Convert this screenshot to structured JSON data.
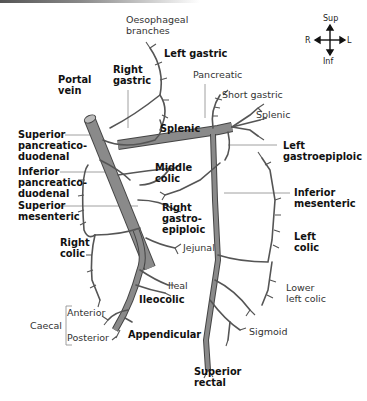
{
  "diagram": {
    "orientation": {
      "sup": "Sup",
      "inf": "Inf",
      "right": "R",
      "left": "L"
    },
    "labels": {
      "oesophageal": "Oesophageal\nbranches",
      "left_gastric": "Left gastric",
      "portal_vein": "Portal\nvein",
      "right_gastric": "Right\ngastric",
      "pancreatic": "Pancreatic",
      "short_gastric": "Short gastric",
      "splenic_branch": "Splenic",
      "splenic": "Splenic",
      "superior_pd": "Superior\npancreatico-\nduodenal",
      "left_gastroepiploic": "Left\ngastroepiploic",
      "inferior_pd": "Inferior\npancreatico-\nduodenal",
      "middle_colic": "Middle\ncolic",
      "inferior_mesenteric": "Inferior\nmesenteric",
      "superior_mesenteric": "Superior\nmesenteric",
      "right_gastroepiploic": "Right\ngastro-\nepiploic",
      "right_colic": "Right\ncolic",
      "left_colic": "Left\ncolic",
      "jejunal": "Jejunal",
      "ileal": "Ileal",
      "lower_left_colic": "Lower\nleft colic",
      "ileocolic": "Ileocolic",
      "caecal": "Caecal",
      "anterior": "Anterior",
      "posterior": "Posterior",
      "appendicular": "Appendicular",
      "sigmoid": "Sigmoid",
      "superior_rectal": "Superior\nrectal"
    },
    "colors": {
      "trunk": "#8a8a8a",
      "vessel_outline": "#444444",
      "text": "#222222",
      "leader_line": "#888888"
    }
  }
}
